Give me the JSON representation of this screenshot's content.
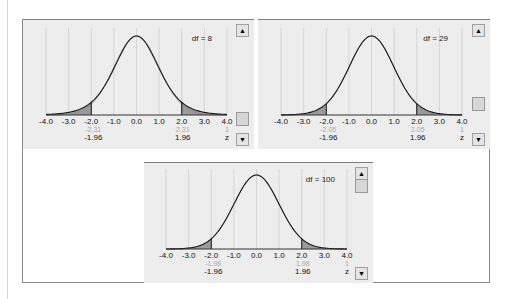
{
  "panels": [
    {
      "id": "df8",
      "df_label": "df = 8",
      "df": 8,
      "critical_t": "2.31",
      "critical_t_neg": "-2.31",
      "critical_z": "1.96",
      "critical_z_neg": "-1.96"
    },
    {
      "id": "df29",
      "df_label": "df = 29",
      "df": 29,
      "critical_t": "2.05",
      "critical_t_neg": "-2.05",
      "critical_z": "1.96",
      "critical_z_neg": "-1.96"
    },
    {
      "id": "df100",
      "df_label": "df = 100",
      "df": 100,
      "critical_t": "1.98",
      "critical_t_neg": "-1.98",
      "critical_z": "1.96",
      "critical_z_neg": "-1.96"
    }
  ],
  "axis": {
    "ticks": [
      "-4.0",
      "-3.0",
      "-2.0",
      "-1.0",
      "0.0",
      "1.0",
      "2.0",
      "3.0",
      "4.0"
    ],
    "t_unit": "t",
    "z_unit": "z"
  },
  "scrollbar": {
    "up": "▲",
    "down": "▼"
  },
  "colors": {
    "panel_bg": "#ededed",
    "grid": "#cfcfcf",
    "curve": "#1a1a1a",
    "tail_fill": "#9a9a9a",
    "t_label": "#a8a8a8",
    "z_label": "#111111"
  },
  "chart_data": [
    {
      "type": "area",
      "title": "t distribution vs standard normal, df = 8",
      "xlabel": "z",
      "xlim": [
        -4.0,
        4.0
      ],
      "x_ticks": [
        -4.0,
        -3.0,
        -2.0,
        -1.0,
        0.0,
        1.0,
        2.0,
        3.0,
        4.0
      ],
      "grid": true,
      "series": [
        {
          "name": "t (df=8) density",
          "peak_at": 0.0
        },
        {
          "name": "normal density",
          "peak_at": 0.0
        }
      ],
      "shaded_tails": {
        "left_below": -2.0,
        "right_above": 2.0
      },
      "annotations": {
        "t_critical": [
          -2.31,
          2.31
        ],
        "z_critical": [
          -1.96,
          1.96
        ],
        "df_label": "df = 8"
      }
    },
    {
      "type": "area",
      "title": "t distribution vs standard normal, df = 29",
      "xlabel": "z",
      "xlim": [
        -4.0,
        4.0
      ],
      "x_ticks": [
        -4.0,
        -3.0,
        -2.0,
        -1.0,
        0.0,
        1.0,
        2.0,
        3.0,
        4.0
      ],
      "grid": true,
      "series": [
        {
          "name": "t (df=29) density",
          "peak_at": 0.0
        },
        {
          "name": "normal density",
          "peak_at": 0.0
        }
      ],
      "shaded_tails": {
        "left_below": -2.0,
        "right_above": 2.0
      },
      "annotations": {
        "t_critical": [
          -2.05,
          2.05
        ],
        "z_critical": [
          -1.96,
          1.96
        ],
        "df_label": "df = 29"
      }
    },
    {
      "type": "area",
      "title": "t distribution vs standard normal, df = 100",
      "xlabel": "z",
      "xlim": [
        -4.0,
        4.0
      ],
      "x_ticks": [
        -4.0,
        -3.0,
        -2.0,
        -1.0,
        0.0,
        1.0,
        2.0,
        3.0,
        4.0
      ],
      "grid": true,
      "series": [
        {
          "name": "t (df=100) density",
          "peak_at": 0.0
        },
        {
          "name": "normal density",
          "peak_at": 0.0
        }
      ],
      "shaded_tails": {
        "left_below": -2.0,
        "right_above": 2.0
      },
      "annotations": {
        "t_critical": [
          -1.98,
          1.98
        ],
        "z_critical": [
          -1.96,
          1.96
        ],
        "df_label": "df = 100"
      }
    }
  ]
}
